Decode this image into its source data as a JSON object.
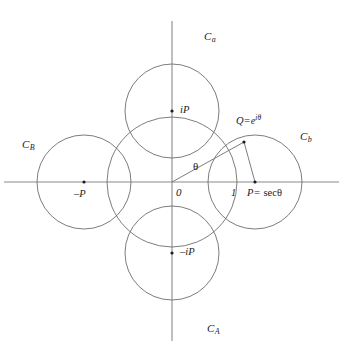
{
  "figure": {
    "background_color": "#ffffff",
    "stroke_color": "#6e6e6e",
    "text_color": "#1b1b1b",
    "width": 343,
    "height": 357
  },
  "axes": {
    "origin": {
      "x": 172,
      "y": 182
    },
    "real_axis": {
      "x1": 4,
      "y1": 182,
      "x2": 339,
      "y2": 182
    },
    "imaginary_axis": {
      "x1": 172,
      "y1": 21,
      "x2": 172,
      "y2": 341
    }
  },
  "circles": [
    {
      "id": "unit-circle",
      "label": "",
      "center": {
        "x": 172,
        "y": 182
      },
      "radius": 65,
      "center_name": "O"
    },
    {
      "id": "circle-c-a-upper",
      "label": "C",
      "subscript": "a",
      "center": {
        "x": 172,
        "y": 111
      },
      "radius": 47,
      "center_name": "iP"
    },
    {
      "id": "circle-c-b-right",
      "label": "C",
      "subscript": "b",
      "center": {
        "x": 255,
        "y": 182
      },
      "radius": 47,
      "center_name": "P"
    },
    {
      "id": "circle-c-B-left",
      "label": "C",
      "subscript": "B",
      "center": {
        "x": 84,
        "y": 182
      },
      "radius": 47,
      "center_name": "-P"
    },
    {
      "id": "circle-c-A-lower",
      "label": "C",
      "subscript": "A",
      "center": {
        "x": 172,
        "y": 253
      },
      "radius": 47,
      "center_name": "-iP"
    }
  ],
  "points": [
    {
      "id": "origin",
      "label": "0",
      "x": 172,
      "y": 182,
      "dot": false
    },
    {
      "id": "point-iP",
      "label": "iP",
      "x": 172,
      "y": 111,
      "dot": true
    },
    {
      "id": "point-minus-iP",
      "label": "-iP",
      "x": 172,
      "y": 253,
      "dot": true
    },
    {
      "id": "point-minus-P",
      "label": "-P",
      "x": 84,
      "y": 182,
      "dot": true
    },
    {
      "id": "point-P",
      "label": "P=",
      "x": 255,
      "y": 182,
      "dot": true
    },
    {
      "id": "point-Q",
      "label": "Q=e",
      "x": 244,
      "y": 142,
      "dot": true
    },
    {
      "id": "point-one",
      "label": "1",
      "x": 237,
      "y": 182,
      "dot": false
    }
  ],
  "segments": [
    {
      "id": "radius-to-Q",
      "x1": 172,
      "y1": 182,
      "x2": 244,
      "y2": 142
    },
    {
      "id": "tangent-Q-to-P",
      "x1": 244,
      "y1": 142,
      "x2": 255,
      "y2": 182
    }
  ],
  "labels": {
    "circle_a": {
      "base": "C",
      "sub": "a",
      "x": 204,
      "y": 36
    },
    "circle_b": {
      "base": "C",
      "sub": "b",
      "x": 300,
      "y": 136
    },
    "circle_B": {
      "base": "C",
      "sub": "B",
      "x": 22,
      "y": 144
    },
    "circle_A": {
      "base": "C",
      "sub": "A",
      "x": 207,
      "y": 328
    },
    "point_iP": {
      "text": "iP",
      "x": 180,
      "y": 105
    },
    "point_minus_iP": {
      "text": "–iP",
      "x": 180,
      "y": 247
    },
    "point_minus_P": {
      "text": "–P",
      "x": 74,
      "y": 190
    },
    "point_P_sec": {
      "ital": "P=",
      "fn": "secθ",
      "x": 247,
      "y": 190
    },
    "point_Q": {
      "base": "Q=e",
      "expo": "iθ",
      "x": 236,
      "y": 117
    },
    "origin": {
      "text": "0",
      "x": 176,
      "y": 188
    },
    "one": {
      "text": "1",
      "x": 231,
      "y": 189
    },
    "theta": {
      "text": "θ",
      "x": 193,
      "y": 166
    }
  }
}
